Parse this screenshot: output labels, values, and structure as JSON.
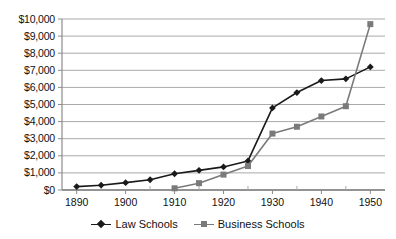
{
  "chart_data": {
    "type": "line",
    "title": "",
    "xlabel": "",
    "ylabel": "",
    "x": [
      1890,
      1895,
      1900,
      1905,
      1910,
      1915,
      1920,
      1925,
      1930,
      1935,
      1940,
      1945,
      1950
    ],
    "xlim": [
      1887,
      1953
    ],
    "ylim": [
      0,
      10000
    ],
    "grid": true,
    "grid_axis": "y",
    "legend_position": "bottom",
    "x_tick_labels": [
      "1890",
      "1900",
      "1910",
      "1920",
      "1930",
      "1940",
      "1950"
    ],
    "x_tick_values": [
      1890,
      1900,
      1910,
      1920,
      1930,
      1940,
      1950
    ],
    "x_minor_tick_values": [
      1895,
      1905,
      1915,
      1925,
      1935,
      1945
    ],
    "y_tick_labels": [
      "$10,000",
      "$9,000",
      "$8,000",
      "$7,000",
      "$6,000",
      "$5,000",
      "$4,000",
      "$3,000",
      "$2,000",
      "$1,000",
      "$0"
    ],
    "y_tick_values": [
      10000,
      9000,
      8000,
      7000,
      6000,
      5000,
      4000,
      3000,
      2000,
      1000,
      0
    ],
    "series": [
      {
        "name": "Law Schools",
        "color": "#1a1a1a",
        "marker": "diamond",
        "x": [
          1890,
          1895,
          1900,
          1905,
          1910,
          1915,
          1920,
          1925,
          1930,
          1935,
          1940,
          1945,
          1950
        ],
        "values": [
          200,
          280,
          430,
          600,
          950,
          1150,
          1350,
          1700,
          4800,
          5700,
          6400,
          6500,
          7200
        ]
      },
      {
        "name": "Business Schools",
        "color": "#7a7a7a",
        "marker": "square",
        "x": [
          1910,
          1915,
          1920,
          1925,
          1930,
          1935,
          1940,
          1945,
          1950
        ],
        "values": [
          100,
          400,
          900,
          1400,
          3300,
          3700,
          4300,
          4900,
          9700
        ]
      }
    ]
  },
  "legend": {
    "items": [
      {
        "label": "Law Schools"
      },
      {
        "label": "Business Schools"
      }
    ]
  }
}
